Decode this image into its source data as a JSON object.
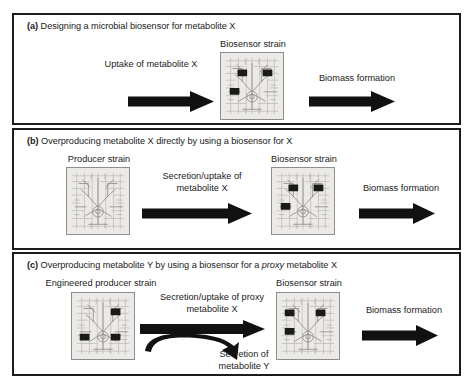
{
  "figure": {
    "background": "#ffffff",
    "border_color": "#1c1c1c",
    "text_color": "#1a1a1a",
    "arrow_color": "#111111",
    "cell_fill": "#eceae7",
    "cell_border": "#8e8e8e",
    "node_color": "#1a1a1a"
  },
  "panels": [
    {
      "id": "a",
      "tag": "(a)",
      "title_rest": " Designing a microbial biosensor for metabolite X",
      "title_plain": "(a) Designing a microbial biosensor for metabolite X",
      "cells": [
        {
          "name": "biosensor-strain",
          "label": "Biosensor strain",
          "nodes": 3
        }
      ],
      "arrows": [
        {
          "name": "uptake-arrow",
          "label": "Uptake of metabolite X",
          "type": "straight"
        },
        {
          "name": "biomass-arrow",
          "label": "Biomass formation",
          "type": "straight"
        }
      ]
    },
    {
      "id": "b",
      "tag": "(b)",
      "title_rest": " Overproducing metabolite X directly by using a biosensor for X",
      "title_plain": "(b) Overproducing metabolite X directly by using a biosensor for X",
      "cells": [
        {
          "name": "producer-strain",
          "label": "Producer strain",
          "nodes": 0
        },
        {
          "name": "biosensor-strain",
          "label": "Biosensor strain",
          "nodes": 3
        }
      ],
      "arrows": [
        {
          "name": "secretion-uptake-arrow",
          "label_line1": "Secretion/uptake of",
          "label_line2": "metabolite X",
          "type": "straight"
        },
        {
          "name": "biomass-arrow",
          "label": "Biomass formation",
          "type": "straight"
        }
      ]
    },
    {
      "id": "c",
      "tag": "(c)",
      "title_pre": " Overproducing metabolite Y by using a biosensor for a ",
      "title_italic": "proxy",
      "title_post": " metabolite X",
      "title_plain": "(c) Overproducing metabolite Y by using a biosensor for a proxy metabolite X",
      "cells": [
        {
          "name": "engineered-producer-strain",
          "label": "Engineered producer strain",
          "nodes": 3
        },
        {
          "name": "biosensor-strain",
          "label": "Biosensor strain",
          "nodes": 3
        }
      ],
      "arrows": [
        {
          "name": "secretion-uptake-proxy-arrow",
          "label_line1": "Secretion/uptake of proxy",
          "label_line2": "metabolite X",
          "type": "branching"
        },
        {
          "name": "secretion-y-branch",
          "label_line1": "Secretion of",
          "label_line2": "metabolite Y",
          "type": "branch-down"
        },
        {
          "name": "biomass-arrow",
          "label": "Biomass formation",
          "type": "straight"
        }
      ]
    }
  ]
}
